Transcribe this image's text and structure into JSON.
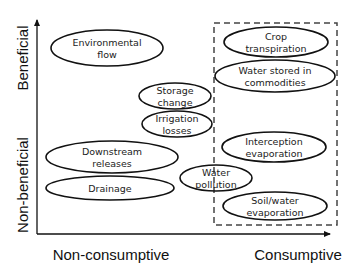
{
  "colors": {
    "background": "#ffffff",
    "stroke": "#111111",
    "text": "#222222",
    "dashed_box": "#444444"
  },
  "axes": {
    "x_label": "Non-consumptive",
    "x_label_right": "Consumptive",
    "y_label_top": "Beneficial",
    "y_label_bottom": "Non-beneficial"
  },
  "nodes": [
    {
      "id": "environmental-flow",
      "lines": [
        "Environmental",
        "flow"
      ],
      "cx": 107,
      "cy": 48,
      "rx": 56,
      "ry": 18
    },
    {
      "id": "crop-transpiration",
      "lines": [
        "Crop",
        "transpiration"
      ],
      "cx": 276,
      "cy": 42,
      "rx": 52,
      "ry": 15
    },
    {
      "id": "water-stored-in-commodities",
      "lines": [
        "Water stored in",
        "commodities"
      ],
      "cx": 275,
      "cy": 76,
      "rx": 60,
      "ry": 16
    },
    {
      "id": "storage-change",
      "lines": [
        "Storage",
        "change"
      ],
      "cx": 175,
      "cy": 96,
      "rx": 36,
      "ry": 13
    },
    {
      "id": "irrigation-losses",
      "lines": [
        "Irrigation",
        "losses"
      ],
      "cx": 177,
      "cy": 124,
      "rx": 35,
      "ry": 13
    },
    {
      "id": "downstream-releases",
      "lines": [
        "Downstream",
        "releases"
      ],
      "cx": 112,
      "cy": 157,
      "rx": 66,
      "ry": 16
    },
    {
      "id": "interception-evaporation",
      "lines": [
        "Interception",
        "evaporation"
      ],
      "cx": 274,
      "cy": 147,
      "rx": 52,
      "ry": 15
    },
    {
      "id": "drainage",
      "lines": [
        "Drainage"
      ],
      "cx": 110,
      "cy": 188,
      "rx": 64,
      "ry": 12
    },
    {
      "id": "water-pollution",
      "lines": [
        "Water",
        "pollution"
      ],
      "cx": 216,
      "cy": 178,
      "rx": 36,
      "ry": 13
    },
    {
      "id": "soil-water-evaporation",
      "lines": [
        "Soil/water",
        "evaporation"
      ],
      "cx": 275,
      "cy": 206,
      "rx": 52,
      "ry": 14
    }
  ],
  "consumptive_box": {
    "x": 214,
    "y": 23,
    "width": 123,
    "height": 202
  }
}
